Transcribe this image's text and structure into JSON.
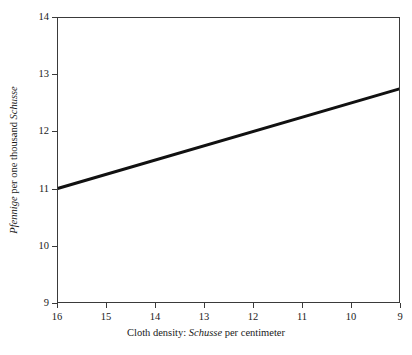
{
  "figure": {
    "background": "#ffffff",
    "axis_color": "#3a3a3a",
    "line_color": "#111111"
  },
  "axes": {
    "x": {
      "label_prefix": "Cloth density: ",
      "label_italic": "Schusse",
      "label_suffix": " per centimeter",
      "ticks": [
        "16",
        "15",
        "14",
        "13",
        "12",
        "11",
        "10",
        "9"
      ]
    },
    "y": {
      "label_italic_1": "Pfennige",
      "label_mid": " per one thousand ",
      "label_italic_2": "Schusse",
      "ticks": [
        "14",
        "13",
        "12",
        "11",
        "10",
        "9"
      ]
    }
  },
  "chart_data": {
    "type": "line",
    "title": "",
    "xlabel": "Cloth density: Schusse per centimeter",
    "ylabel": "Pfennige per one thousand Schusse",
    "xlim": [
      16,
      9
    ],
    "ylim": [
      9,
      14
    ],
    "x_axis_reversed": true,
    "grid": false,
    "legend": null,
    "xticks": [
      16,
      15,
      14,
      13,
      12,
      11,
      10,
      9
    ],
    "yticks": [
      9,
      10,
      11,
      12,
      13,
      14
    ],
    "series": [
      {
        "name": "wage rate",
        "x": [
          16,
          9
        ],
        "y": [
          11.0,
          12.75
        ],
        "color": "#111111",
        "linewidth": 3
      }
    ]
  }
}
